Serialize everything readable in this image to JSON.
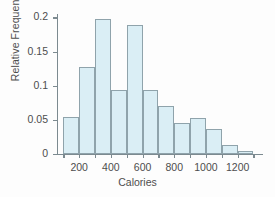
{
  "chart_data": {
    "type": "bar",
    "title": "",
    "xlabel": "Calories",
    "ylabel": "Relative Frequency",
    "grid": false,
    "legend": false,
    "xlim": [
      60,
      1360
    ],
    "ylim": [
      0,
      0.205
    ],
    "bin_width": 100,
    "bin_edges": [
      100,
      200,
      300,
      400,
      500,
      600,
      700,
      800,
      900,
      1000,
      1100,
      1200,
      1300
    ],
    "categories": [
      "100-200",
      "200-300",
      "300-400",
      "400-500",
      "500-600",
      "600-700",
      "700-800",
      "800-900",
      "900-1000",
      "1000-1100",
      "1100-1200",
      "1200-1300"
    ],
    "values": [
      0.054,
      0.127,
      0.198,
      0.094,
      0.189,
      0.094,
      0.07,
      0.046,
      0.053,
      0.037,
      0.013,
      0.005
    ],
    "xticks": [
      200,
      400,
      600,
      800,
      1000,
      1200
    ],
    "xtick_labels": [
      "200",
      "400",
      "600",
      "800",
      "1000",
      "1200"
    ],
    "yticks": [
      0,
      0.05,
      0.1,
      0.15,
      0.2
    ],
    "ytick_labels": [
      "0",
      "0.05",
      "0.1",
      "0.15",
      "0.2"
    ],
    "bar_fill_color": "#daeef5",
    "bar_edge_color": "#8fa3ab",
    "axis_color": "#7c8a90",
    "text_color": "#4d4d4d"
  }
}
